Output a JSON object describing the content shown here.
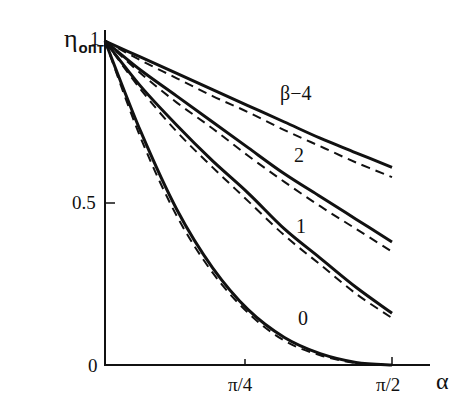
{
  "chart_data": {
    "type": "line",
    "title": "",
    "xlabel": "α",
    "ylabel": "η_опт",
    "ylabel_main": "η",
    "ylabel_sub": "опт",
    "xlim": [
      0,
      1.5708
    ],
    "ylim": [
      0,
      1
    ],
    "x_ticks": [
      {
        "value": 0,
        "label": "0"
      },
      {
        "value": 0.7854,
        "label": "π/4"
      },
      {
        "value": 1.5708,
        "label": "π/2"
      }
    ],
    "y_ticks": [
      {
        "value": 0,
        "label": "0"
      },
      {
        "value": 0.5,
        "label": "0.5"
      },
      {
        "value": 1,
        "label": "1"
      }
    ],
    "grid": false,
    "legend": "inline curve labels",
    "x": [
      0,
      0.196,
      0.393,
      0.589,
      0.785,
      0.982,
      1.178,
      1.374,
      1.571
    ],
    "series": [
      {
        "name": "β=4 (solid)",
        "label": "β−4",
        "style": "solid",
        "values": [
          1.0,
          0.95,
          0.9,
          0.85,
          0.8,
          0.75,
          0.7,
          0.655,
          0.61
        ]
      },
      {
        "name": "β=4 (dashed)",
        "style": "dashed",
        "values": [
          1.0,
          0.94,
          0.885,
          0.83,
          0.78,
          0.725,
          0.675,
          0.625,
          0.58
        ]
      },
      {
        "name": "β=2 (solid)",
        "label": "2",
        "style": "solid",
        "values": [
          1.0,
          0.91,
          0.83,
          0.75,
          0.67,
          0.59,
          0.52,
          0.45,
          0.38
        ]
      },
      {
        "name": "β=2 (dashed)",
        "style": "dashed",
        "values": [
          1.0,
          0.9,
          0.81,
          0.73,
          0.645,
          0.565,
          0.49,
          0.42,
          0.35
        ]
      },
      {
        "name": "β=1 (solid)",
        "label": "1",
        "style": "solid",
        "values": [
          1.0,
          0.86,
          0.74,
          0.63,
          0.53,
          0.42,
          0.33,
          0.24,
          0.16
        ]
      },
      {
        "name": "β=1 (dashed)",
        "style": "dashed",
        "values": [
          1.0,
          0.85,
          0.72,
          0.61,
          0.505,
          0.4,
          0.31,
          0.22,
          0.145
        ]
      },
      {
        "name": "β=0 (solid)",
        "label": "0",
        "style": "solid",
        "values": [
          1.0,
          0.72,
          0.48,
          0.3,
          0.17,
          0.085,
          0.035,
          0.008,
          0.0
        ]
      },
      {
        "name": "β=0 (dashed)",
        "style": "dashed",
        "values": [
          1.0,
          0.7,
          0.46,
          0.285,
          0.16,
          0.075,
          0.03,
          0.006,
          0.0
        ]
      }
    ],
    "annotations": [
      "β−4",
      "2",
      "1",
      "0"
    ]
  },
  "labels": {
    "y_main": "η",
    "y_sub": "опт",
    "x_axis": "α",
    "y_tick_1": "1",
    "y_tick_05": "0.5",
    "origin": "0",
    "x_tick_pi4": "π/4",
    "x_tick_pi2": "π/2",
    "curve_b4": "β−4",
    "curve_b2": "2",
    "curve_b1": "1",
    "curve_b0": "0"
  },
  "colors": {
    "ink": "#111111",
    "background": "#ffffff"
  }
}
